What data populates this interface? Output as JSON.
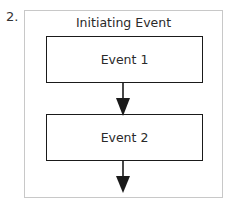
{
  "figure": {
    "number_label": "2.",
    "title": "Initiating Event",
    "boxes": [
      {
        "label": "Event 1"
      },
      {
        "label": "Event 2"
      }
    ],
    "arrows": [
      {
        "from": "Event 1",
        "to": "Event 2"
      },
      {
        "from": "Event 2",
        "to": ""
      }
    ],
    "colors": {
      "line": "#1a1a1a",
      "frame": "#c8c8c8",
      "background": "#ffffff"
    }
  }
}
